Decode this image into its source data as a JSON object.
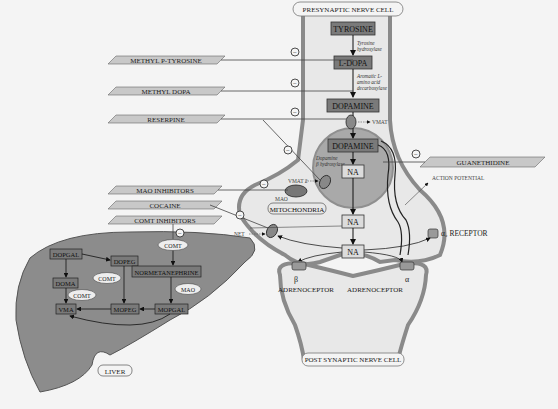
{
  "cells": {
    "presynaptic": "PRESYNAPTIC NERVE CELL",
    "postsynaptic": "POST SYNAPTIC NERVE CELL",
    "liver": "LIVER"
  },
  "synthesis": {
    "tyrosine": "TYROSINE",
    "ldopa": "L-DOPA",
    "dopamine": "DOPAMINE",
    "dopamine_vesicle": "DOPAMINE",
    "na_vesicle": "NA",
    "na_terminal": "NA",
    "na_cleft": "NA",
    "enzyme1_l1": "Tyrosine",
    "enzyme1_l2": "hydroxylase",
    "enzyme2_l1": "Aromatic L-",
    "enzyme2_l2": "amino acid",
    "enzyme2_l3": "decarboxylase",
    "enzyme3_l1": "Dopamine",
    "enzyme3_l2": "β hydroxylase"
  },
  "transporters": {
    "vmat": "VMAT",
    "vmat2": "VMAT 2",
    "net": "NET",
    "mao": "MAO",
    "mitochondria": "MITOCHONDRIA"
  },
  "drugs": {
    "methyl_p_tyrosine": "METHYL P-TYROSINE",
    "methyl_dopa": "METHYL DOPA",
    "reserpine": "RESERPINE",
    "mao_inhibitors": "MAO INHIBITORS",
    "cocaine": "COCAINE",
    "comt_inhibitors": "COMT INHIBITORS",
    "guanethidine": "GUANETHIDINE",
    "inhibit_symbol": "−"
  },
  "receptors": {
    "action_potential": "ACTION POTENTIAL",
    "alpha2": "α₂ RECEPTOR",
    "beta_symbol": "β",
    "alpha_symbol": "α",
    "beta_label": "ADRENOCEPTOR",
    "alpha_label": "ADRENOCEPTOR"
  },
  "liver_metabolism": {
    "dopgal": "DOPGAL",
    "dopeg": "DOPEG",
    "doma": "DOMA",
    "vma": "VMA",
    "mopeg": "MOPEG",
    "mopgal": "MOPGAL",
    "normetanephrine": "NORMETANEPHRINE",
    "comt_top": "COMT",
    "comt_mid": "COMT",
    "comt_low": "COMT",
    "mao": "MAO"
  },
  "colors": {
    "background": "#f4f4f4",
    "cell_fill": "#e6e6e6",
    "cell_border": "#8a8a8a",
    "box_fill": "#7a7a7a",
    "liver_fill": "#8c8c8c",
    "vesicle_fill": "#a9a9a9",
    "drug_fill": "#c8c8c8"
  }
}
